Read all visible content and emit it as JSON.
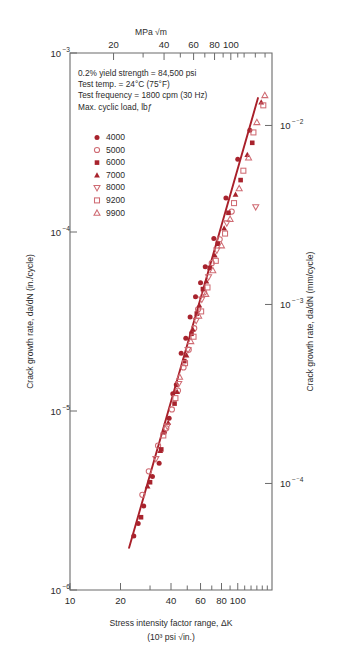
{
  "chart_data": {
    "type": "scatter",
    "title": "",
    "xlabel": "Stress intensity factor range, ΔK",
    "xlabel_units": "(10³ psi √in.)",
    "ylabel": "Crack growth rate, da/dN (in./cycle)",
    "ylabel_right": "Crack growth rate, da/dN (mm/cycle)",
    "xlabel_top": "MPa √m",
    "xscale": "log",
    "yscale": "log",
    "xlim": [
      10,
      160
    ],
    "ylim": [
      1e-06,
      0.001
    ],
    "ylim_right": [
      2.54e-05,
      0.0254
    ],
    "xlim_top": [
      11,
      176
    ],
    "grid": false,
    "legend_position": "upper-left-inside",
    "x_ticks": [
      "10",
      "20",
      "40",
      "60",
      "80",
      "100"
    ],
    "x_tick_values": [
      10,
      20,
      40,
      60,
      80,
      100
    ],
    "x_minor_values": [
      30,
      50,
      70,
      90,
      110,
      120,
      130,
      140,
      150
    ],
    "y_ticks": [
      "10⁻³",
      "10⁻⁴",
      "10⁻⁵",
      "10⁻⁶"
    ],
    "y_tick_values": [
      0.001,
      0.0001,
      1e-05,
      1e-06
    ],
    "y_ticks_right": [
      "10⁻²",
      "10⁻³",
      "10⁻⁴"
    ],
    "y_tick_values_right": [
      0.01,
      0.001,
      0.0001
    ],
    "top_ticks": [
      "20",
      "40",
      "60",
      "80",
      "100"
    ],
    "top_tick_values": [
      20,
      40,
      60,
      80,
      100
    ],
    "top_minor_values": [
      30,
      50,
      70,
      90,
      110,
      120,
      140,
      160
    ],
    "annotations": [
      "0.2% yield strength = 84,500 psi",
      "Test temp. = 24°C (75°F)",
      "Test frequency = 1800 cpm (30 Hz)",
      "Max. cyclic load, lbƒ"
    ],
    "trend_line": {
      "name": "power-law fit",
      "color": "#a9202a",
      "points": [
        [
          22.5,
          1.72e-06
        ],
        [
          132,
          0.00056
        ]
      ]
    },
    "series": [
      {
        "name": "4000",
        "label": "4000",
        "marker": "filled-circle",
        "color": "#a8232d",
        "points": [
          [
            24.0,
            2e-06
          ],
          [
            25.5,
            2.35e-06
          ],
          [
            27.5,
            2.95e-06
          ],
          [
            31.0,
            4.3e-06
          ],
          [
            34.0,
            5.1e-06
          ],
          [
            36.5,
            7.6e-06
          ],
          [
            39.0,
            9.1e-06
          ],
          [
            41.0,
            1.25e-05
          ],
          [
            43.0,
            1.4e-05
          ],
          [
            46.0,
            2.1e-05
          ],
          [
            49.0,
            2.55e-05
          ],
          [
            52.0,
            3.35e-05
          ],
          [
            56.0,
            4.35e-05
          ],
          [
            60.0,
            5.2e-05
          ],
          [
            64.0,
            6.4e-05
          ],
          [
            72.0,
            9.2e-05
          ],
          [
            85.0,
            0.000155
          ],
          [
            100.0,
            0.000255
          ],
          [
            118.0,
            0.00037
          ]
        ]
      },
      {
        "name": "5000",
        "label": "5000",
        "marker": "open-circle",
        "color": "#cf6b73",
        "points": [
          [
            27.0,
            3.4e-06
          ],
          [
            29.5,
            4.6e-06
          ],
          [
            33.5,
            6.4e-06
          ],
          [
            37.5,
            8e-06
          ],
          [
            40.5,
            1.02e-05
          ],
          [
            44.0,
            1.3e-05
          ],
          [
            47.5,
            1.75e-05
          ],
          [
            51.0,
            2.2e-05
          ],
          [
            55.0,
            2.9e-05
          ],
          [
            58.0,
            3.7e-05
          ],
          [
            63.0,
            4.6e-05
          ],
          [
            70.0,
            6.7e-05
          ],
          [
            78.0,
            9.1e-05
          ],
          [
            92.0,
            0.00013
          ]
        ]
      },
      {
        "name": "6000",
        "label": "6000",
        "marker": "filled-square",
        "color": "#a8232d",
        "points": [
          [
            26.5,
            2.55e-06
          ],
          [
            30.0,
            4e-06
          ],
          [
            35.0,
            6.1e-06
          ],
          [
            42.0,
            1.1e-05
          ],
          [
            48.0,
            1.9e-05
          ],
          [
            53.0,
            2.7e-05
          ],
          [
            57.0,
            3.5e-05
          ],
          [
            62.0,
            4.8e-05
          ],
          [
            68.0,
            6.3e-05
          ],
          [
            76.0,
            8.6e-05
          ],
          [
            88.0,
            0.000128
          ],
          [
            104.0,
            0.000195
          ],
          [
            122.0,
            0.000315
          ]
        ]
      },
      {
        "name": "7000",
        "label": "7000",
        "marker": "filled-triangle",
        "color": "#a8232d",
        "points": [
          [
            29.0,
            3.8e-06
          ],
          [
            34.5,
            6e-06
          ],
          [
            38.5,
            8.6e-06
          ],
          [
            43.5,
            1.28e-05
          ],
          [
            49.5,
            2.05e-05
          ],
          [
            54.0,
            2.85e-05
          ],
          [
            59.0,
            3.9e-05
          ],
          [
            65.0,
            5.3e-05
          ],
          [
            73.0,
            7.4e-05
          ],
          [
            83.0,
            0.000105
          ],
          [
            97.0,
            0.000162
          ],
          [
            114.0,
            0.00027
          ],
          [
            138.0,
            0.00053
          ]
        ]
      },
      {
        "name": "8000",
        "label": "8000",
        "marker": "open-down-triangle",
        "color": "#cf6b73",
        "points": [
          [
            32.5,
            5.4e-06
          ],
          [
            38.0,
            8.2e-06
          ],
          [
            44.5,
            1.42e-05
          ],
          [
            50.5,
            2.2e-05
          ],
          [
            56.5,
            3.2e-05
          ],
          [
            61.0,
            4.2e-05
          ],
          [
            67.0,
            5.6e-05
          ],
          [
            75.0,
            7.9e-05
          ],
          [
            86.0,
            0.000112
          ],
          [
            128.0,
            0.000138
          ]
        ]
      },
      {
        "name": "9200",
        "label": "9200",
        "marker": "open-square",
        "color": "#cf6b73",
        "points": [
          [
            36.0,
            7.3e-06
          ],
          [
            42.5,
            1.18e-05
          ],
          [
            48.5,
            1.85e-05
          ],
          [
            54.5,
            2.6e-05
          ],
          [
            60.5,
            3.6e-05
          ],
          [
            66.0,
            4.9e-05
          ],
          [
            74.0,
            6.9e-05
          ],
          [
            84.0,
            9.8e-05
          ],
          [
            95.0,
            0.000145
          ],
          [
            108.0,
            0.00022
          ],
          [
            124.0,
            0.00036
          ],
          [
            142.0,
            0.00051
          ]
        ]
      },
      {
        "name": "9900",
        "label": "9900",
        "marker": "open-triangle",
        "color": "#cf6b73",
        "points": [
          [
            45.0,
            1.55e-05
          ],
          [
            52.5,
            2.45e-05
          ],
          [
            58.5,
            3.4e-05
          ],
          [
            64.5,
            4.5e-05
          ],
          [
            71.0,
            6.1e-05
          ],
          [
            80.0,
            8.4e-05
          ],
          [
            90.0,
            0.000118
          ],
          [
            102.0,
            0.000175
          ],
          [
            116.0,
            0.00026
          ],
          [
            130.0,
            0.00041
          ],
          [
            145.0,
            0.00058
          ]
        ]
      }
    ]
  }
}
